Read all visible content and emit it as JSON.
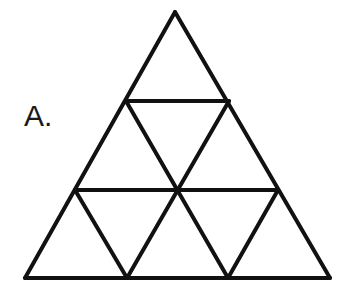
{
  "figure": {
    "label": "A.",
    "type": "subdivided-equilateral-triangle",
    "rows": 3,
    "small_triangle_count": 9,
    "upward_triangle_count": 6,
    "downward_triangle_count": 3,
    "stroke_color": "#111111",
    "fill_color": "#ffffff",
    "background_color": "#ffffff",
    "stroke_width": 4,
    "geometry": {
      "apex": [
        175,
        12
      ],
      "bottom_left": [
        25,
        278
      ],
      "bottom_right": [
        330,
        278
      ],
      "row_divider_y": [
        101,
        190
      ],
      "row1_left": [
        126,
        101
      ],
      "row1_right": [
        229,
        101
      ],
      "row2_left": [
        75,
        190
      ],
      "row2_center": [
        177,
        190
      ],
      "row2_right": [
        278,
        190
      ],
      "base_left_node": [
        127,
        278
      ],
      "base_right_node": [
        228,
        278
      ]
    },
    "rows_detail": [
      {
        "index": 1,
        "up": 1,
        "down": 0,
        "total": 1
      },
      {
        "index": 2,
        "up": 2,
        "down": 1,
        "total": 3
      },
      {
        "index": 3,
        "up": 3,
        "down": 2,
        "total": 5
      }
    ]
  }
}
